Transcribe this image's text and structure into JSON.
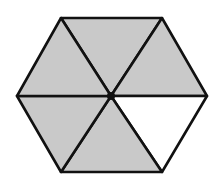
{
  "figure": {
    "shape": "regular hexagon",
    "divisions": 6,
    "shaded_count": 5,
    "unshaded_count": 1,
    "shaded_fraction": "5/6",
    "shaded_color": "#c9c9c9",
    "unshaded_color": "#ffffff",
    "stroke_color": "#111111",
    "center_dot": true
  }
}
